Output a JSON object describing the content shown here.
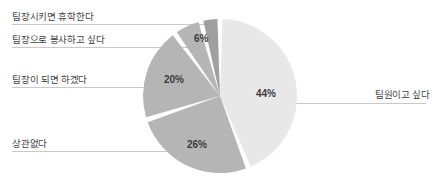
{
  "chart_data": {
    "type": "pie",
    "title": "",
    "categories": [
      "팀원이고 싶다",
      "상관없다",
      "팀장이 되면 하겠다",
      "팀장으로 봉사하고 싶다",
      "팀장시키면 휴학한다"
    ],
    "values": [
      44,
      26,
      20,
      6,
      4
    ],
    "value_labels": [
      "44%",
      "26%",
      "20%",
      "6%",
      ""
    ],
    "units": "%",
    "legend": "callout-labels",
    "grid": false,
    "colors": [
      "#e8e8e8",
      "#b5b5b5",
      "#b5b5b5",
      "#b5b5b5",
      "#a0a0a0"
    ],
    "slice_gap_color": "#ffffff",
    "start_angle_deg": 0,
    "direction": "clockwise"
  },
  "slices": [
    {
      "name": "팀원이고 싶다",
      "percent_label": "44%",
      "value": 44,
      "color": "#e8e8e8",
      "pct_x": 256,
      "pct_y": 88,
      "callout_side": "right"
    },
    {
      "name": "상관없다",
      "percent_label": "26%",
      "value": 26,
      "color": "#b5b5b5",
      "pct_x": 187,
      "pct_y": 139,
      "callout_side": "left"
    },
    {
      "name": "팀장이 되면 하겠다",
      "percent_label": "20%",
      "value": 20,
      "color": "#b5b5b5",
      "pct_x": 164,
      "pct_y": 74,
      "callout_side": "left"
    },
    {
      "name": "팀장으로 봉사하고 싶다",
      "percent_label": "6%",
      "value": 6,
      "color": "#b5b5b5",
      "pct_x": 194,
      "pct_y": 33,
      "callout_side": "left"
    },
    {
      "name": "팀장시키면 휴학한다",
      "percent_label": "",
      "value": 4,
      "color": "#a0a0a0",
      "callout_side": "left"
    }
  ],
  "callouts": {
    "left": [
      {
        "label": "팀장시키면 휴학한다",
        "text_y": 11,
        "line_y": 24.5,
        "line_x1": 12,
        "line_x2": 206
      },
      {
        "label": "팀장으로 봉사하고 싶다",
        "text_y": 34,
        "line_y": 47.5,
        "line_x1": 12,
        "line_x2": 196
      },
      {
        "label": "팀장이 되면 하겠다",
        "text_y": 74,
        "line_y": 87.5,
        "line_x1": 12,
        "line_x2": 160
      },
      {
        "label": "상관없다",
        "text_y": 138,
        "line_y": 151.5,
        "line_x1": 12,
        "line_x2": 186
      }
    ],
    "right": [
      {
        "label": "팀원이고 싶다",
        "text_y": 89,
        "line_y": 103.5,
        "line_x1": 262,
        "line_x2": 426
      }
    ]
  },
  "style": {
    "background": "#ffffff",
    "leader_line_color": "#c9c9c9",
    "text_color": "#3f3f3f",
    "percent_text_color": "#3c3c3c"
  }
}
